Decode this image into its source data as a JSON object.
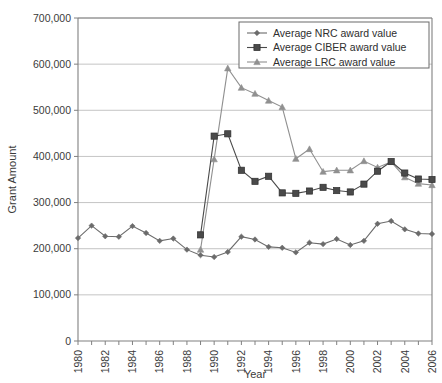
{
  "chart_data": {
    "type": "line",
    "title": "",
    "xlabel": "Year",
    "ylabel": "Grant Amount",
    "xlim": [
      1980,
      2006
    ],
    "ylim": [
      0,
      700000
    ],
    "grid": true,
    "legend_position": "top-right",
    "x": [
      1980,
      1981,
      1982,
      1983,
      1984,
      1985,
      1986,
      1987,
      1988,
      1989,
      1990,
      1991,
      1992,
      1993,
      1994,
      1995,
      1996,
      1997,
      1998,
      1999,
      2000,
      2001,
      2002,
      2003,
      2004,
      2005,
      2006
    ],
    "xtick_labels": [
      "1980",
      "1982",
      "1984",
      "1986",
      "1988",
      "1990",
      "1992",
      "1994",
      "1996",
      "1998",
      "2000",
      "2002",
      "2004",
      "2006"
    ],
    "xtick_values": [
      1980,
      1982,
      1984,
      1986,
      1988,
      1990,
      1992,
      1994,
      1996,
      1998,
      2000,
      2002,
      2004,
      2006
    ],
    "ytick_labels": [
      "0",
      "100,000",
      "200,000",
      "300,000",
      "400,000",
      "500,000",
      "600,000",
      "700,000"
    ],
    "ytick_values": [
      0,
      100000,
      200000,
      300000,
      400000,
      500000,
      600000,
      700000
    ],
    "series": [
      {
        "name": "Average NRC award value",
        "marker": "diamond",
        "color": "#6b6b6b",
        "x": [
          1980,
          1981,
          1982,
          1983,
          1984,
          1985,
          1986,
          1987,
          1988,
          1989,
          1990,
          1991,
          1992,
          1993,
          1994,
          1995,
          1996,
          1997,
          1998,
          1999,
          2000,
          2001,
          2002,
          2003,
          2004,
          2005,
          2006
        ],
        "values": [
          223000,
          250000,
          227000,
          226000,
          249000,
          234000,
          217000,
          222000,
          198000,
          186000,
          182000,
          193000,
          226000,
          220000,
          204000,
          202000,
          192000,
          213000,
          210000,
          221000,
          208000,
          217000,
          254000,
          260000,
          242000,
          233000,
          232000
        ]
      },
      {
        "name": "Average CIBER award value",
        "marker": "square",
        "color": "#4a4a4a",
        "x": [
          1989,
          1990,
          1991,
          1992,
          1993,
          1994,
          1995,
          1996,
          1997,
          1998,
          1999,
          2000,
          2001,
          2002,
          2003,
          2004,
          2005,
          2006
        ],
        "values": [
          230000,
          444000,
          449000,
          370000,
          346000,
          357000,
          321000,
          320000,
          325000,
          333000,
          326000,
          323000,
          340000,
          368000,
          389000,
          364000,
          351000,
          350000
        ]
      },
      {
        "name": "Average LRC award value",
        "marker": "triangle",
        "color": "#909090",
        "x": [
          1989,
          1990,
          1991,
          1992,
          1993,
          1994,
          1995,
          1996,
          1997,
          1998,
          1999,
          2000,
          2001,
          2002,
          2003,
          2004,
          2005,
          2006
        ],
        "values": [
          198000,
          394000,
          591000,
          549000,
          536000,
          521000,
          507000,
          395000,
          416000,
          367000,
          370000,
          370000,
          390000,
          376000,
          388000,
          355000,
          341000,
          338000
        ]
      }
    ]
  },
  "legend": {
    "items": [
      {
        "label": "Average NRC award value"
      },
      {
        "label": "Average CIBER award value"
      },
      {
        "label": "Average LRC award value"
      }
    ]
  }
}
